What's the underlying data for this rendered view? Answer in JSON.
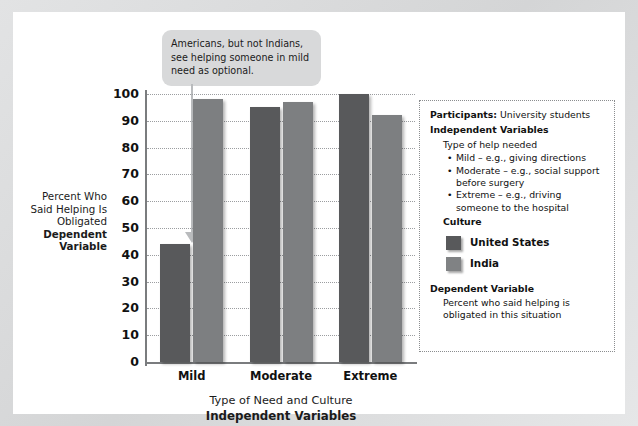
{
  "callout": {
    "text": "Americans, but not Indians, see helping someone in mild need as optional."
  },
  "axis": {
    "y_label_plain": "Percent Who Said Helping Is Obligated",
    "y_label_bold": "Dependent Variable",
    "x_label_plain": "Type of Need and Culture",
    "x_label_bold": "Independent Variables"
  },
  "legend": {
    "participants_label": "Participants:",
    "participants_value": "University students",
    "independent_variables_header": "Independent Variables",
    "type_of_help": "Type of help needed",
    "help_items": [
      "Mild – e.g., giving directions",
      "Moderate – e.g., social support before surgery",
      "Extreme – e.g., driving someone to the hospital"
    ],
    "culture_header": "Culture",
    "series": [
      {
        "name": "United States",
        "color": "#58595b",
        "swatch": "us"
      },
      {
        "name": "India",
        "color": "#808284",
        "swatch": "india"
      }
    ],
    "dependent_variable_header": "Dependent Variable",
    "dependent_variable_text": "Percent who said helping is obligated in this situation"
  },
  "chart_data": {
    "type": "bar",
    "title": "",
    "xlabel": "Type of Need and Culture",
    "ylabel": "Percent Who Said Helping Is Obligated",
    "ylim": [
      0,
      100
    ],
    "yticks": [
      0,
      10,
      20,
      30,
      40,
      50,
      60,
      70,
      80,
      90,
      100
    ],
    "grid": true,
    "legend_position": "right",
    "categories": [
      "Mild",
      "Moderate",
      "Extreme"
    ],
    "series": [
      {
        "name": "United States",
        "color": "#58595b",
        "values": [
          44,
          95,
          100
        ]
      },
      {
        "name": "India",
        "color": "#7d7f81",
        "values": [
          98,
          97,
          92
        ]
      }
    ],
    "annotations": [
      {
        "text": "Americans, but not Indians, see helping someone in mild need as optional.",
        "points_to": {
          "category": "Mild",
          "series": "United States",
          "value": 44
        }
      }
    ]
  }
}
